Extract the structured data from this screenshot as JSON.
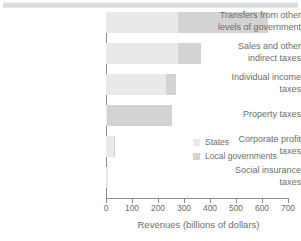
{
  "chart_data": {
    "type": "bar",
    "orientation": "horizontal",
    "stacked": true,
    "title": "",
    "xlabel": "Revenues (billions of dollars)",
    "ylabel": "",
    "xlim": [
      0,
      700
    ],
    "xticks": [
      0,
      100,
      200,
      300,
      400,
      500,
      600,
      700
    ],
    "xticklabels": [
      "0",
      "100",
      "200",
      "300",
      "400",
      "500",
      "600",
      "700"
    ],
    "grid": false,
    "legend_position": "inside-right",
    "categories": [
      "Transfers from other levels of government",
      "Sales and other indirect taxes",
      "Individual income taxes",
      "Property taxes",
      "Corporate profit taxes",
      "Social insurance taxes"
    ],
    "category_lines": [
      [
        "Transfers from other",
        "levels of government"
      ],
      [
        "Sales and other",
        "indirect taxes"
      ],
      [
        "Individual income",
        "taxes"
      ],
      [
        "Property taxes"
      ],
      [
        "Corporate profit",
        "taxes"
      ],
      [
        "Social insurance",
        "taxes"
      ]
    ],
    "series": [
      {
        "name": "States",
        "color": "#e9e9e9",
        "values": [
          278,
          277,
          230,
          5,
          30,
          8
        ]
      },
      {
        "name": "Local governments",
        "color": "#d3d3d3",
        "values": [
          345,
          88,
          40,
          250,
          2,
          0
        ]
      }
    ],
    "totals": [
      623,
      365,
      270,
      255,
      32,
      8
    ]
  },
  "axis": {
    "x_title": "Revenues (billions of dollars)"
  },
  "legend": {
    "items": [
      {
        "label": "States",
        "color": "#e9e9e9"
      },
      {
        "label": "Local governments",
        "color": "#d3d3d3"
      }
    ]
  }
}
